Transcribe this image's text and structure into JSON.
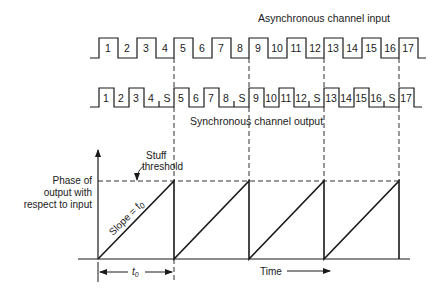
{
  "diagram": {
    "async_title": "Asynchronous channel input",
    "sync_title": "Synchronous channel output",
    "async_slots": [
      "1",
      "2",
      "3",
      "4",
      "5",
      "6",
      "7",
      "8",
      "9",
      "10",
      "11",
      "12",
      "13",
      "14",
      "15",
      "16",
      "17"
    ],
    "sync_slots": [
      "1",
      "2",
      "3",
      "4",
      "S",
      "5",
      "6",
      "7",
      "8",
      "S",
      "9",
      "10",
      "11",
      "12",
      "S",
      "13",
      "14",
      "15",
      "16",
      "S",
      "17"
    ],
    "phase_plot": {
      "ylabel_line1": "Phase of",
      "ylabel_line2": "output with",
      "ylabel_line3": "respect to input",
      "threshold_label_line1": "Stuff",
      "threshold_label_line2": "threshold",
      "slope_label": "Slope = f",
      "slope_sub": "0",
      "period_label": "t",
      "period_sub": "0",
      "xlabel": "Time"
    }
  }
}
